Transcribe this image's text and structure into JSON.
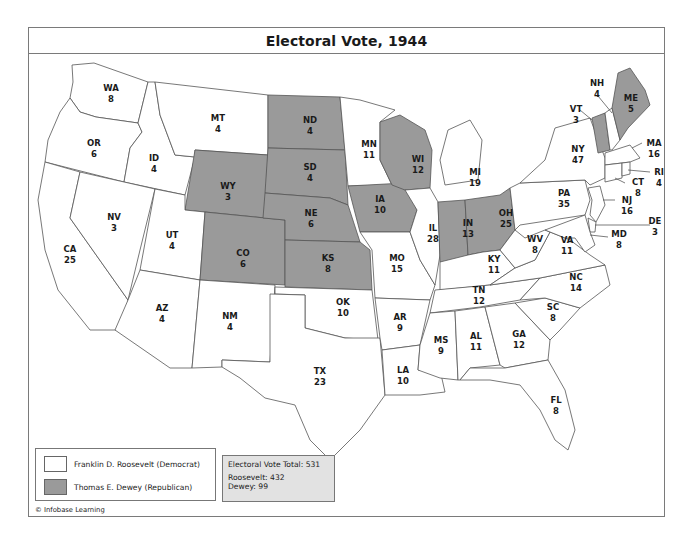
{
  "map": {
    "title": "Electoral Vote, 1944",
    "credit": "© Infobase Learning",
    "colors": {
      "roosevelt": "#ffffff",
      "dewey": "#9a9a9a",
      "border": "#555555",
      "totals_bg": "#e2e2e2"
    }
  },
  "legend": {
    "items": [
      {
        "label": "Franklin D. Roosevelt (Democrat)",
        "color": "#ffffff"
      },
      {
        "label": "Thomas E. Dewey (Republican)",
        "color": "#9a9a9a"
      }
    ]
  },
  "totals": {
    "total": "Electoral Vote Total: 531",
    "roosevelt": "Roosevelt: 432",
    "dewey": "Dewey: 99"
  },
  "states": {
    "WA": {
      "abbr": "WA",
      "votes": "8",
      "winner": "Roosevelt"
    },
    "OR": {
      "abbr": "OR",
      "votes": "6",
      "winner": "Roosevelt"
    },
    "CA": {
      "abbr": "CA",
      "votes": "25",
      "winner": "Roosevelt"
    },
    "ID": {
      "abbr": "ID",
      "votes": "4",
      "winner": "Roosevelt"
    },
    "NV": {
      "abbr": "NV",
      "votes": "3",
      "winner": "Roosevelt"
    },
    "MT": {
      "abbr": "MT",
      "votes": "4",
      "winner": "Roosevelt"
    },
    "WY": {
      "abbr": "WY",
      "votes": "3",
      "winner": "Dewey"
    },
    "UT": {
      "abbr": "UT",
      "votes": "4",
      "winner": "Roosevelt"
    },
    "AZ": {
      "abbr": "AZ",
      "votes": "4",
      "winner": "Roosevelt"
    },
    "CO": {
      "abbr": "CO",
      "votes": "6",
      "winner": "Dewey"
    },
    "NM": {
      "abbr": "NM",
      "votes": "4",
      "winner": "Roosevelt"
    },
    "ND": {
      "abbr": "ND",
      "votes": "4",
      "winner": "Dewey"
    },
    "SD": {
      "abbr": "SD",
      "votes": "4",
      "winner": "Dewey"
    },
    "NE": {
      "abbr": "NE",
      "votes": "6",
      "winner": "Dewey"
    },
    "KS": {
      "abbr": "KS",
      "votes": "8",
      "winner": "Dewey"
    },
    "OK": {
      "abbr": "OK",
      "votes": "10",
      "winner": "Roosevelt"
    },
    "TX": {
      "abbr": "TX",
      "votes": "23",
      "winner": "Roosevelt"
    },
    "MN": {
      "abbr": "MN",
      "votes": "11",
      "winner": "Roosevelt"
    },
    "IA": {
      "abbr": "IA",
      "votes": "10",
      "winner": "Dewey"
    },
    "MO": {
      "abbr": "MO",
      "votes": "15",
      "winner": "Roosevelt"
    },
    "AR": {
      "abbr": "AR",
      "votes": "9",
      "winner": "Roosevelt"
    },
    "LA": {
      "abbr": "LA",
      "votes": "10",
      "winner": "Roosevelt"
    },
    "WI": {
      "abbr": "WI",
      "votes": "12",
      "winner": "Dewey"
    },
    "IL": {
      "abbr": "IL",
      "votes": "28",
      "winner": "Roosevelt"
    },
    "MI": {
      "abbr": "MI",
      "votes": "19",
      "winner": "Roosevelt"
    },
    "IN": {
      "abbr": "IN",
      "votes": "13",
      "winner": "Dewey"
    },
    "OH": {
      "abbr": "OH",
      "votes": "25",
      "winner": "Dewey"
    },
    "KY": {
      "abbr": "KY",
      "votes": "11",
      "winner": "Roosevelt"
    },
    "TN": {
      "abbr": "TN",
      "votes": "12",
      "winner": "Roosevelt"
    },
    "MS": {
      "abbr": "MS",
      "votes": "9",
      "winner": "Roosevelt"
    },
    "AL": {
      "abbr": "AL",
      "votes": "11",
      "winner": "Roosevelt"
    },
    "GA": {
      "abbr": "GA",
      "votes": "12",
      "winner": "Roosevelt"
    },
    "FL": {
      "abbr": "FL",
      "votes": "8",
      "winner": "Roosevelt"
    },
    "SC": {
      "abbr": "SC",
      "votes": "8",
      "winner": "Roosevelt"
    },
    "NC": {
      "abbr": "NC",
      "votes": "14",
      "winner": "Roosevelt"
    },
    "VA": {
      "abbr": "VA",
      "votes": "11",
      "winner": "Roosevelt"
    },
    "WV": {
      "abbr": "WV",
      "votes": "8",
      "winner": "Roosevelt"
    },
    "PA": {
      "abbr": "PA",
      "votes": "35",
      "winner": "Roosevelt"
    },
    "NY": {
      "abbr": "NY",
      "votes": "47",
      "winner": "Roosevelt"
    },
    "VT": {
      "abbr": "VT",
      "votes": "3",
      "winner": "Dewey"
    },
    "NH": {
      "abbr": "NH",
      "votes": "4",
      "winner": "Roosevelt"
    },
    "ME": {
      "abbr": "ME",
      "votes": "5",
      "winner": "Dewey"
    },
    "MA": {
      "abbr": "MA",
      "votes": "16",
      "winner": "Roosevelt"
    },
    "RI": {
      "abbr": "RI",
      "votes": "4",
      "winner": "Roosevelt"
    },
    "CT": {
      "abbr": "CT",
      "votes": "8",
      "winner": "Roosevelt"
    },
    "NJ": {
      "abbr": "NJ",
      "votes": "16",
      "winner": "Roosevelt"
    },
    "DE": {
      "abbr": "DE",
      "votes": "3",
      "winner": "Roosevelt"
    },
    "MD": {
      "abbr": "MD",
      "votes": "8",
      "winner": "Roosevelt"
    }
  }
}
